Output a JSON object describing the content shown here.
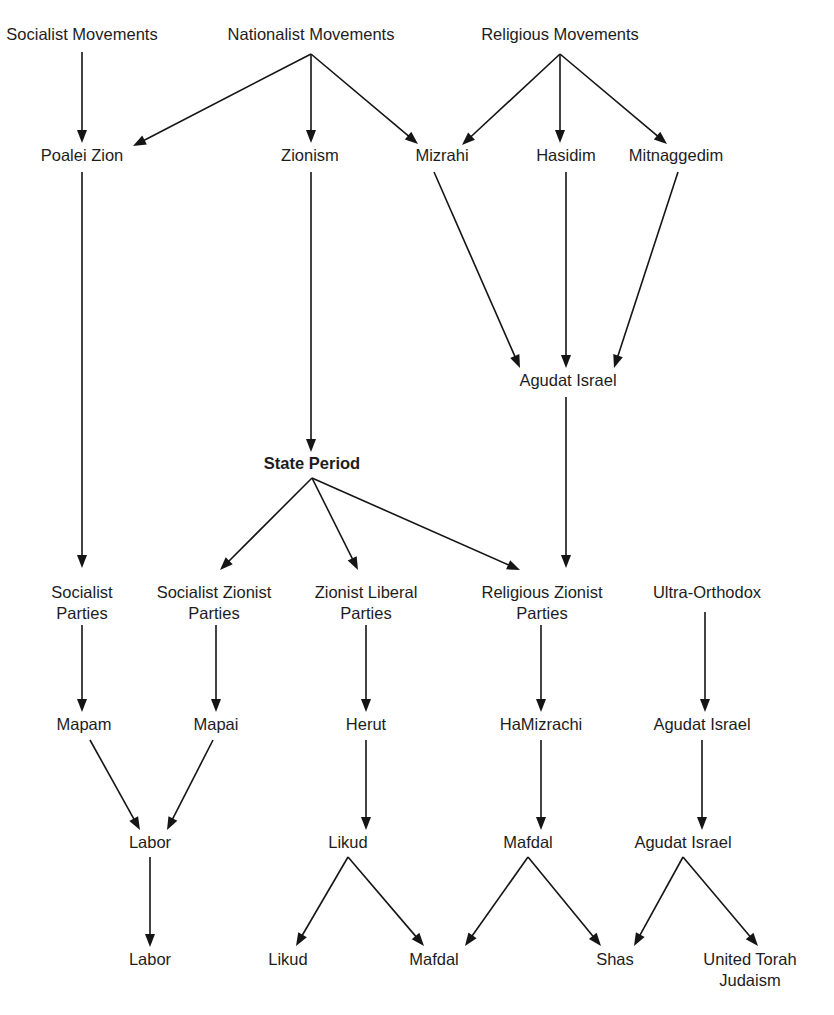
{
  "diagram": {
    "background_color": "#ffffff",
    "line_color": "#151515",
    "text_color": "#1d1d1d",
    "nodes": [
      {
        "id": "socialist-movements",
        "label": "Socialist Movements",
        "x": 82,
        "y": 40,
        "bold": false,
        "lines": [
          "Socialist Movements"
        ]
      },
      {
        "id": "nationalist-movements",
        "label": "Nationalist Movements",
        "x": 311,
        "y": 40,
        "bold": false,
        "lines": [
          "Nationalist Movements"
        ]
      },
      {
        "id": "religious-movements",
        "label": "Religious Movements",
        "x": 560,
        "y": 40,
        "bold": false,
        "lines": [
          "Religious Movements"
        ]
      },
      {
        "id": "poalei-zion",
        "label": "Poalei Zion",
        "x": 82,
        "y": 161,
        "bold": false,
        "lines": [
          "Poalei Zion"
        ]
      },
      {
        "id": "zionism",
        "label": "Zionism",
        "x": 310,
        "y": 161,
        "bold": false,
        "lines": [
          "Zionism"
        ]
      },
      {
        "id": "mizrahi",
        "label": "Mizrahi",
        "x": 442,
        "y": 161,
        "bold": false,
        "lines": [
          "Mizrahi"
        ]
      },
      {
        "id": "hasidim",
        "label": "Hasidim",
        "x": 566,
        "y": 161,
        "bold": false,
        "lines": [
          "Hasidim"
        ]
      },
      {
        "id": "mitnaggedim",
        "label": "Mitnaggedim",
        "x": 676,
        "y": 161,
        "bold": false,
        "lines": [
          "Mitnaggedim"
        ]
      },
      {
        "id": "agudat-israel-top",
        "label": "Agudat Israel",
        "x": 568,
        "y": 386,
        "bold": false,
        "lines": [
          "Agudat Israel"
        ]
      },
      {
        "id": "state-period",
        "label": "State Period",
        "x": 312,
        "y": 469,
        "bold": true,
        "lines": [
          "State Period"
        ]
      },
      {
        "id": "socialist-parties",
        "label": "Socialist Parties",
        "x": 82,
        "y": 598,
        "bold": false,
        "lines": [
          "Socialist",
          "Parties"
        ]
      },
      {
        "id": "socialist-zionist-parties",
        "label": "Socialist Zionist Parties",
        "x": 214,
        "y": 598,
        "bold": false,
        "lines": [
          "Socialist Zionist",
          "Parties"
        ]
      },
      {
        "id": "zionist-liberal-parties",
        "label": "Zionist Liberal Parties",
        "x": 366,
        "y": 598,
        "bold": false,
        "lines": [
          "Zionist Liberal",
          "Parties"
        ]
      },
      {
        "id": "religious-zionist-parties",
        "label": "Religious Zionist Parties",
        "x": 542,
        "y": 598,
        "bold": false,
        "lines": [
          "Religious Zionist",
          "Parties"
        ]
      },
      {
        "id": "ultra-orthodox",
        "label": "Ultra-Orthodox",
        "x": 707,
        "y": 598,
        "bold": false,
        "lines": [
          "Ultra-Orthodox"
        ]
      },
      {
        "id": "mapam",
        "label": "Mapam",
        "x": 84,
        "y": 730,
        "bold": false,
        "lines": [
          "Mapam"
        ]
      },
      {
        "id": "mapai",
        "label": "Mapai",
        "x": 216,
        "y": 730,
        "bold": false,
        "lines": [
          "Mapai"
        ]
      },
      {
        "id": "herut",
        "label": "Herut",
        "x": 366,
        "y": 730,
        "bold": false,
        "lines": [
          "Herut"
        ]
      },
      {
        "id": "hamizrachi",
        "label": "HaMizrachi",
        "x": 541,
        "y": 730,
        "bold": false,
        "lines": [
          "HaMizrachi"
        ]
      },
      {
        "id": "agudat-israel-mid",
        "label": "Agudat Israel",
        "x": 702,
        "y": 730,
        "bold": false,
        "lines": [
          "Agudat Israel"
        ]
      },
      {
        "id": "labor-mid",
        "label": "Labor",
        "x": 150,
        "y": 848,
        "bold": false,
        "lines": [
          "Labor"
        ]
      },
      {
        "id": "likud-mid",
        "label": "Likud",
        "x": 348,
        "y": 848,
        "bold": false,
        "lines": [
          "Likud"
        ]
      },
      {
        "id": "mafdal-mid",
        "label": "Mafdal",
        "x": 528,
        "y": 848,
        "bold": false,
        "lines": [
          "Mafdal"
        ]
      },
      {
        "id": "agudat-israel-bottom",
        "label": "Agudat Israel",
        "x": 683,
        "y": 848,
        "bold": false,
        "lines": [
          "Agudat Israel"
        ]
      },
      {
        "id": "labor-final",
        "label": "Labor",
        "x": 150,
        "y": 965,
        "bold": false,
        "lines": [
          "Labor"
        ]
      },
      {
        "id": "likud-final",
        "label": "Likud",
        "x": 288,
        "y": 965,
        "bold": false,
        "lines": [
          "Likud"
        ]
      },
      {
        "id": "mafdal-final",
        "label": "Mafdal",
        "x": 434,
        "y": 965,
        "bold": false,
        "lines": [
          "Mafdal"
        ]
      },
      {
        "id": "shas-final",
        "label": "Shas",
        "x": 615,
        "y": 965,
        "bold": false,
        "lines": [
          "Shas"
        ]
      },
      {
        "id": "utj-final",
        "label": "United Torah Judaism",
        "x": 750,
        "y": 965,
        "bold": false,
        "lines": [
          "United Torah",
          "Judaism"
        ]
      }
    ],
    "edges": [
      {
        "id": "e1",
        "from": "socialist-movements",
        "to": "poalei-zion",
        "x1": 82,
        "y1": 52,
        "x2": 82,
        "y2": 143
      },
      {
        "id": "e2",
        "from": "nationalist-movements",
        "to": "poalei-zion",
        "x1": 311,
        "y1": 54,
        "x2": 133,
        "y2": 146
      },
      {
        "id": "e3",
        "from": "nationalist-movements",
        "to": "zionism",
        "x1": 311,
        "y1": 54,
        "x2": 311,
        "y2": 143
      },
      {
        "id": "e4",
        "from": "nationalist-movements",
        "to": "mizrahi",
        "x1": 311,
        "y1": 54,
        "x2": 418,
        "y2": 144
      },
      {
        "id": "e5",
        "from": "religious-movements",
        "to": "mizrahi",
        "x1": 560,
        "y1": 54,
        "x2": 462,
        "y2": 145
      },
      {
        "id": "e6",
        "from": "religious-movements",
        "to": "hasidim",
        "x1": 560,
        "y1": 54,
        "x2": 560,
        "y2": 143
      },
      {
        "id": "e7",
        "from": "religious-movements",
        "to": "mitnaggedim",
        "x1": 560,
        "y1": 54,
        "x2": 667,
        "y2": 144
      },
      {
        "id": "e8",
        "from": "poalei-zion",
        "to": "socialist-parties",
        "x1": 82,
        "y1": 172,
        "x2": 82,
        "y2": 568
      },
      {
        "id": "e9",
        "from": "zionism",
        "to": "state-period",
        "x1": 311,
        "y1": 172,
        "x2": 311,
        "y2": 452
      },
      {
        "id": "e10",
        "from": "mizrahi",
        "to": "agudat-israel-top",
        "x1": 434,
        "y1": 172,
        "x2": 520,
        "y2": 368
      },
      {
        "id": "e11",
        "from": "hasidim",
        "to": "agudat-israel-top",
        "x1": 566,
        "y1": 172,
        "x2": 566,
        "y2": 368
      },
      {
        "id": "e12",
        "from": "mitnaggedim",
        "to": "agudat-israel-top",
        "x1": 678,
        "y1": 172,
        "x2": 614,
        "y2": 368
      },
      {
        "id": "e13",
        "from": "agudat-israel-top",
        "to": "religious-zionist-parties",
        "x1": 566,
        "y1": 397,
        "x2": 566,
        "y2": 568
      },
      {
        "id": "e14",
        "from": "state-period",
        "to": "socialist-zionist-parties",
        "x1": 312,
        "y1": 478,
        "x2": 220,
        "y2": 570
      },
      {
        "id": "e15",
        "from": "state-period",
        "to": "zionist-liberal-parties",
        "x1": 312,
        "y1": 478,
        "x2": 358,
        "y2": 570
      },
      {
        "id": "e16",
        "from": "state-period",
        "to": "religious-zionist-parties",
        "x1": 312,
        "y1": 478,
        "x2": 520,
        "y2": 570
      },
      {
        "id": "e17",
        "from": "socialist-parties",
        "to": "mapam",
        "x1": 82,
        "y1": 625,
        "x2": 82,
        "y2": 712
      },
      {
        "id": "e18",
        "from": "socialist-zionist-parties",
        "to": "mapai",
        "x1": 216,
        "y1": 625,
        "x2": 216,
        "y2": 712
      },
      {
        "id": "e19",
        "from": "zionist-liberal-parties",
        "to": "herut",
        "x1": 366,
        "y1": 625,
        "x2": 366,
        "y2": 712
      },
      {
        "id": "e20",
        "from": "religious-zionist-parties",
        "to": "hamizrachi",
        "x1": 541,
        "y1": 625,
        "x2": 541,
        "y2": 712
      },
      {
        "id": "e21",
        "from": "ultra-orthodox",
        "to": "agudat-israel-mid",
        "x1": 705,
        "y1": 612,
        "x2": 705,
        "y2": 712
      },
      {
        "id": "e22",
        "from": "mapam",
        "to": "labor-mid",
        "x1": 90,
        "y1": 740,
        "x2": 140,
        "y2": 830
      },
      {
        "id": "e23",
        "from": "mapai",
        "to": "labor-mid",
        "x1": 213,
        "y1": 740,
        "x2": 167,
        "y2": 830
      },
      {
        "id": "e24",
        "from": "herut",
        "to": "likud-mid",
        "x1": 366,
        "y1": 740,
        "x2": 366,
        "y2": 830
      },
      {
        "id": "e25",
        "from": "hamizrachi",
        "to": "mafdal-mid",
        "x1": 541,
        "y1": 740,
        "x2": 541,
        "y2": 830
      },
      {
        "id": "e26",
        "from": "agudat-israel-mid",
        "to": "agudat-israel-bottom",
        "x1": 702,
        "y1": 740,
        "x2": 702,
        "y2": 830
      },
      {
        "id": "e27",
        "from": "labor-mid",
        "to": "labor-final",
        "x1": 150,
        "y1": 857,
        "x2": 150,
        "y2": 947
      },
      {
        "id": "e28",
        "from": "likud-mid",
        "to": "likud-final",
        "x1": 348,
        "y1": 857,
        "x2": 296,
        "y2": 946
      },
      {
        "id": "e29",
        "from": "likud-mid",
        "to": "mafdal-final",
        "x1": 348,
        "y1": 857,
        "x2": 424,
        "y2": 946
      },
      {
        "id": "e30",
        "from": "mafdal-mid",
        "to": "mafdal-final",
        "x1": 528,
        "y1": 857,
        "x2": 465,
        "y2": 946
      },
      {
        "id": "e31",
        "from": "mafdal-mid",
        "to": "shas-final",
        "x1": 528,
        "y1": 857,
        "x2": 601,
        "y2": 946
      },
      {
        "id": "e32",
        "from": "agudat-israel-bottom",
        "to": "shas-final",
        "x1": 683,
        "y1": 857,
        "x2": 634,
        "y2": 946
      },
      {
        "id": "e33",
        "from": "agudat-israel-bottom",
        "to": "utj-final",
        "x1": 683,
        "y1": 857,
        "x2": 758,
        "y2": 946
      }
    ]
  }
}
